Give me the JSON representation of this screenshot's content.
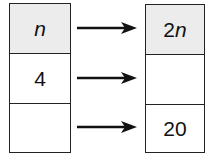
{
  "input_table": {
    "header": "n",
    "rows": [
      "4",
      ""
    ]
  },
  "output_table": {
    "header_prefix": "2",
    "header_var": "n",
    "rows": [
      "",
      "20"
    ]
  },
  "arrows": 3,
  "colors": {
    "header_fill": "#ececec",
    "line": "#222222"
  }
}
